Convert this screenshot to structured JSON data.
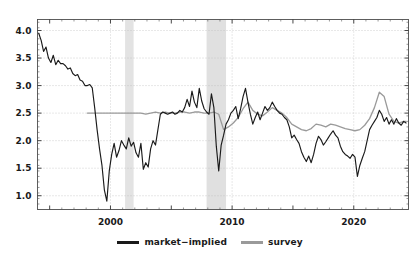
{
  "chart_data": {
    "type": "line",
    "title": "",
    "xlabel": "",
    "ylabel": "",
    "xlim": [
      1994.0,
      2024.5
    ],
    "ylim": [
      0.75,
      4.2
    ],
    "xticks": [
      2000,
      2010,
      2020
    ],
    "xticklabels": [
      "2000",
      "2010",
      "2020"
    ],
    "yticks": [
      1.0,
      1.5,
      2.0,
      2.5,
      3.0,
      3.5,
      4.0
    ],
    "yticklabels": [
      "1.0",
      "1.5",
      "2.0",
      "2.5",
      "3.0",
      "3.5",
      "4.0"
    ],
    "grid": true,
    "grid_style": "dotted",
    "legend_position": "bottom-center",
    "shaded_regions": [
      {
        "name": "recession-2001",
        "x0": 2001.2,
        "x1": 2001.9,
        "color": "#e3e3e3"
      },
      {
        "name": "recession-2008",
        "x0": 2007.9,
        "x1": 2009.5,
        "color": "#e0e0e0"
      }
    ],
    "series": [
      {
        "name": "market-implied",
        "color": "#1a1a1a",
        "x": [
          1994.1,
          1994.3,
          1994.5,
          1994.7,
          1994.9,
          1995.1,
          1995.3,
          1995.5,
          1995.7,
          1995.9,
          1996.1,
          1996.3,
          1996.5,
          1996.7,
          1996.9,
          1997.1,
          1997.3,
          1997.5,
          1997.7,
          1997.9,
          1998.1,
          1998.3,
          1998.5,
          1998.7,
          1998.9,
          1999.1,
          1999.3,
          1999.5,
          1999.7,
          1999.9,
          2000.1,
          2000.3,
          2000.5,
          2000.7,
          2000.9,
          2001.1,
          2001.3,
          2001.5,
          2001.7,
          2001.9,
          2002.1,
          2002.3,
          2002.5,
          2002.7,
          2002.9,
          2003.1,
          2003.3,
          2003.5,
          2003.7,
          2003.9,
          2004.1,
          2004.3,
          2004.5,
          2004.7,
          2004.9,
          2005.1,
          2005.3,
          2005.5,
          2005.7,
          2005.9,
          2006.1,
          2006.3,
          2006.5,
          2006.7,
          2006.9,
          2007.1,
          2007.3,
          2007.5,
          2007.7,
          2007.9,
          2008.1,
          2008.3,
          2008.5,
          2008.7,
          2008.9,
          2009.1,
          2009.3,
          2009.5,
          2009.7,
          2009.9,
          2010.1,
          2010.3,
          2010.5,
          2010.7,
          2010.9,
          2011.1,
          2011.3,
          2011.5,
          2011.7,
          2011.9,
          2012.1,
          2012.3,
          2012.5,
          2012.7,
          2012.9,
          2013.1,
          2013.3,
          2013.5,
          2013.7,
          2013.9,
          2014.1,
          2014.3,
          2014.5,
          2014.7,
          2014.9,
          2015.1,
          2015.3,
          2015.5,
          2015.7,
          2015.9,
          2016.1,
          2016.3,
          2016.5,
          2016.7,
          2016.9,
          2017.1,
          2017.3,
          2017.5,
          2017.7,
          2017.9,
          2018.1,
          2018.3,
          2018.5,
          2018.7,
          2018.9,
          2019.1,
          2019.3,
          2019.5,
          2019.7,
          2019.9,
          2020.1,
          2020.3,
          2020.5,
          2020.7,
          2020.9,
          2021.1,
          2021.3,
          2021.5,
          2021.7,
          2021.9,
          2022.1,
          2022.3,
          2022.5,
          2022.7,
          2022.9,
          2023.1,
          2023.3,
          2023.5,
          2023.7,
          2023.9,
          2024.1,
          2024.3
        ],
        "y": [
          3.95,
          3.82,
          3.62,
          3.7,
          3.5,
          3.42,
          3.55,
          3.38,
          3.46,
          3.4,
          3.4,
          3.36,
          3.3,
          3.32,
          3.22,
          3.18,
          3.2,
          3.1,
          3.08,
          3.0,
          3.0,
          3.02,
          2.96,
          2.6,
          2.2,
          1.85,
          1.55,
          1.1,
          0.9,
          1.45,
          1.75,
          1.95,
          1.7,
          1.82,
          2.0,
          1.92,
          1.85,
          2.05,
          1.9,
          1.97,
          1.78,
          1.7,
          1.95,
          1.48,
          1.6,
          1.52,
          1.85,
          2.0,
          1.92,
          2.2,
          2.48,
          2.52,
          2.5,
          2.48,
          2.5,
          2.52,
          2.48,
          2.5,
          2.55,
          2.52,
          2.6,
          2.75,
          2.62,
          2.9,
          2.7,
          2.6,
          2.95,
          2.72,
          2.58,
          2.52,
          2.48,
          2.85,
          2.6,
          1.9,
          1.45,
          1.92,
          2.1,
          2.3,
          2.38,
          2.5,
          2.55,
          2.62,
          2.4,
          2.58,
          2.8,
          2.95,
          2.7,
          2.48,
          2.3,
          2.42,
          2.52,
          2.38,
          2.5,
          2.62,
          2.55,
          2.6,
          2.7,
          2.62,
          2.55,
          2.5,
          2.48,
          2.42,
          2.38,
          2.25,
          2.05,
          2.1,
          2.02,
          1.95,
          1.8,
          1.7,
          1.62,
          1.72,
          1.6,
          1.75,
          1.95,
          2.08,
          2.02,
          1.92,
          1.98,
          2.05,
          2.12,
          2.18,
          2.1,
          2.05,
          1.9,
          1.8,
          1.75,
          1.72,
          1.68,
          1.75,
          1.7,
          1.35,
          1.55,
          1.68,
          1.8,
          2.0,
          2.2,
          2.28,
          2.35,
          2.42,
          2.55,
          2.48,
          2.35,
          2.42,
          2.3,
          2.38,
          2.3,
          2.4,
          2.32,
          2.28,
          2.35,
          2.32
        ]
      },
      {
        "name": "survey",
        "color": "#9a9a9a",
        "x": [
          1998.1,
          1998.5,
          1998.9,
          1999.3,
          1999.7,
          2000.1,
          2000.5,
          2000.9,
          2001.3,
          2001.7,
          2002.1,
          2002.5,
          2002.9,
          2003.3,
          2003.7,
          2004.1,
          2004.5,
          2004.9,
          2005.3,
          2005.7,
          2006.1,
          2006.5,
          2006.9,
          2007.3,
          2007.7,
          2008.1,
          2008.5,
          2008.9,
          2009.3,
          2009.7,
          2010.1,
          2010.5,
          2010.9,
          2011.3,
          2011.7,
          2012.1,
          2012.5,
          2012.9,
          2013.3,
          2013.7,
          2014.1,
          2014.5,
          2014.9,
          2015.3,
          2015.7,
          2016.1,
          2016.5,
          2016.9,
          2017.3,
          2017.7,
          2018.1,
          2018.5,
          2018.9,
          2019.3,
          2019.7,
          2020.1,
          2020.5,
          2020.9,
          2021.3,
          2021.7,
          2022.1,
          2022.5,
          2022.9,
          2023.3,
          2023.7,
          2024.1,
          2024.3
        ],
        "y": [
          2.5,
          2.5,
          2.5,
          2.5,
          2.5,
          2.5,
          2.5,
          2.5,
          2.5,
          2.5,
          2.5,
          2.5,
          2.48,
          2.5,
          2.52,
          2.5,
          2.52,
          2.5,
          2.5,
          2.52,
          2.52,
          2.5,
          2.52,
          2.52,
          2.5,
          2.5,
          2.52,
          2.48,
          2.2,
          2.25,
          2.32,
          2.42,
          2.58,
          2.7,
          2.55,
          2.48,
          2.45,
          2.52,
          2.6,
          2.55,
          2.5,
          2.42,
          2.3,
          2.25,
          2.2,
          2.18,
          2.22,
          2.3,
          2.28,
          2.25,
          2.3,
          2.28,
          2.25,
          2.22,
          2.2,
          2.18,
          2.2,
          2.28,
          2.4,
          2.6,
          2.88,
          2.8,
          2.48,
          2.35,
          2.32,
          2.35,
          2.35
        ]
      }
    ]
  },
  "legend": {
    "entries": [
      {
        "label": "market−implied",
        "color": "#1a1a1a"
      },
      {
        "label": "survey",
        "color": "#9a9a9a"
      }
    ]
  }
}
